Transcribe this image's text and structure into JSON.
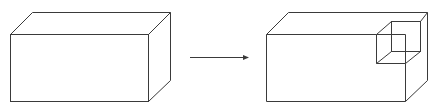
{
  "diagram": {
    "line_color": "#3a3a3a",
    "background": "#ffffff",
    "left_box": {
      "front": {
        "x": 10,
        "y": 34,
        "w": 138,
        "h": 67
      },
      "depth_offset": {
        "dx": 22,
        "dy": -22
      }
    },
    "arrow": {
      "x1": 190,
      "y1": 57,
      "x2": 249,
      "y2": 57
    },
    "right_box": {
      "front": {
        "x": 266,
        "y": 34,
        "w": 139,
        "h": 67
      },
      "depth_offset": {
        "dx": 22,
        "dy": -22
      }
    },
    "cutout_cube": {
      "front": {
        "x": 376,
        "y": 34,
        "size": 29
      },
      "back": {
        "x": 391,
        "y": 21,
        "size": 30
      }
    }
  }
}
